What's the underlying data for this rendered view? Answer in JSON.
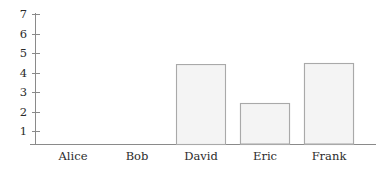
{
  "chart_data": {
    "type": "bar",
    "title": "",
    "subtitle": "",
    "xlabel": "",
    "ylabel": "",
    "categories": [
      "Alice",
      "Bob",
      "David",
      "Eric",
      "Frank"
    ],
    "values": [
      5.05,
      3.05,
      4.1,
      2.1,
      4.15
    ],
    "series": [
      {
        "name": "",
        "values": [
          5.05,
          3.05,
          4.1,
          2.1,
          4.15
        ]
      }
    ],
    "ylim": [
      0,
      7
    ],
    "xlim": [
      0,
      5
    ],
    "ytick_labels": [
      "1",
      "2",
      "3",
      "4",
      "5",
      "6",
      "7"
    ],
    "ytick_values": [
      1,
      2,
      3,
      4,
      5,
      6,
      7
    ],
    "xtick_labels": [
      "Alice",
      "Bob",
      "David",
      "Eric",
      "Frank"
    ],
    "grid": false,
    "legend": false,
    "legend_position": "none",
    "colors": {
      "bar_fill": "#f4f4f4",
      "bar_border": "#a9a9a9",
      "axis": "#8a8a8a",
      "text": "#2b2b2b",
      "background": "#ffffff"
    }
  },
  "axes": {
    "y_axis_name": "y-axis",
    "x_axis_name": "x-axis"
  }
}
